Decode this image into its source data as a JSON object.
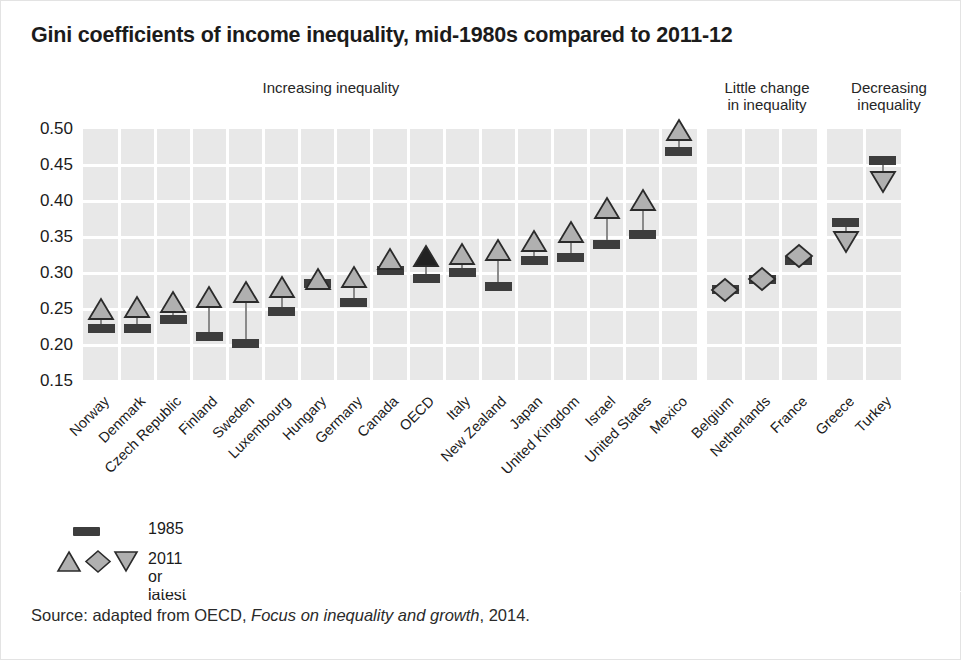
{
  "chart_data": {
    "type": "scatter",
    "title": "Gini coefficients of income inequality, mid-1980s compared to 2011-12",
    "xlabel": "",
    "ylabel": "",
    "ylim": [
      0.15,
      0.5
    ],
    "ytick_labels": [
      "0.50",
      "0.45",
      "0.40",
      "0.35",
      "0.30",
      "0.25",
      "0.20",
      "0.15"
    ],
    "ytick_values": [
      0.5,
      0.45,
      0.4,
      0.35,
      0.3,
      0.25,
      0.2,
      0.15
    ],
    "grid": true,
    "legend_position": "bottom-left",
    "series": [
      {
        "name": "1985",
        "marker": "bar",
        "values": [
          0.223,
          0.223,
          0.236,
          0.212,
          0.202,
          0.247,
          0.289,
          0.259,
          0.304,
          0.293,
          0.301,
          0.281,
          0.317,
          0.322,
          0.339,
          0.354,
          0.469,
          0.277,
          0.291,
          0.318,
          0.37,
          0.456
        ]
      },
      {
        "name": "2011 or latest",
        "marker": "triangle-up/diamond/triangle-down",
        "values": [
          0.25,
          0.253,
          0.26,
          0.266,
          0.274,
          0.281,
          0.289,
          0.295,
          0.32,
          0.324,
          0.327,
          0.332,
          0.345,
          0.357,
          0.39,
          0.401,
          0.498,
          0.277,
          0.291,
          0.323,
          0.343,
          0.427
        ]
      }
    ],
    "categories": [
      "Norway",
      "Denmark",
      "Czech Republic",
      "Finland",
      "Sweden",
      "Luxembourg",
      "Hungary",
      "Germany",
      "Canada",
      "OECD",
      "Italy",
      "New Zealand",
      "Japan",
      "United Kingdom",
      "Israel",
      "United States",
      "Mexico",
      "Belgium",
      "Netherlands",
      "France",
      "Greece",
      "Turkey"
    ],
    "points": [
      {
        "country": "Norway",
        "group": "increasing",
        "v1985": 0.223,
        "v2011": 0.25,
        "shape": "triangle-up",
        "highlight": false
      },
      {
        "country": "Denmark",
        "group": "increasing",
        "v1985": 0.223,
        "v2011": 0.253,
        "shape": "triangle-up",
        "highlight": false
      },
      {
        "country": "Czech Republic",
        "group": "increasing",
        "v1985": 0.236,
        "v2011": 0.26,
        "shape": "triangle-up",
        "highlight": false
      },
      {
        "country": "Finland",
        "group": "increasing",
        "v1985": 0.212,
        "v2011": 0.266,
        "shape": "triangle-up",
        "highlight": false
      },
      {
        "country": "Sweden",
        "group": "increasing",
        "v1985": 0.202,
        "v2011": 0.274,
        "shape": "triangle-up",
        "highlight": false
      },
      {
        "country": "Luxembourg",
        "group": "increasing",
        "v1985": 0.247,
        "v2011": 0.281,
        "shape": "triangle-up",
        "highlight": false
      },
      {
        "country": "Hungary",
        "group": "increasing",
        "v1985": 0.286,
        "v2011": 0.291,
        "shape": "triangle-up",
        "highlight": false
      },
      {
        "country": "Germany",
        "group": "increasing",
        "v1985": 0.259,
        "v2011": 0.295,
        "shape": "triangle-up",
        "highlight": false
      },
      {
        "country": "Canada",
        "group": "increasing",
        "v1985": 0.304,
        "v2011": 0.32,
        "shape": "triangle-up",
        "highlight": false
      },
      {
        "country": "OECD",
        "group": "increasing",
        "v1985": 0.293,
        "v2011": 0.324,
        "shape": "triangle-up",
        "highlight": true
      },
      {
        "country": "Italy",
        "group": "increasing",
        "v1985": 0.301,
        "v2011": 0.327,
        "shape": "triangle-up",
        "highlight": false
      },
      {
        "country": "New Zealand",
        "group": "increasing",
        "v1985": 0.281,
        "v2011": 0.332,
        "shape": "triangle-up",
        "highlight": false
      },
      {
        "country": "Japan",
        "group": "increasing",
        "v1985": 0.317,
        "v2011": 0.345,
        "shape": "triangle-up",
        "highlight": false
      },
      {
        "country": "United Kingdom",
        "group": "increasing",
        "v1985": 0.322,
        "v2011": 0.357,
        "shape": "triangle-up",
        "highlight": false
      },
      {
        "country": "Israel",
        "group": "increasing",
        "v1985": 0.339,
        "v2011": 0.39,
        "shape": "triangle-up",
        "highlight": false
      },
      {
        "country": "United States",
        "group": "increasing",
        "v1985": 0.354,
        "v2011": 0.401,
        "shape": "triangle-up",
        "highlight": false
      },
      {
        "country": "Mexico",
        "group": "increasing",
        "v1985": 0.469,
        "v2011": 0.498,
        "shape": "triangle-up",
        "highlight": false
      },
      {
        "country": "Belgium",
        "group": "little-change",
        "v1985": 0.277,
        "v2011": 0.277,
        "shape": "diamond",
        "highlight": false
      },
      {
        "country": "Netherlands",
        "group": "little-change",
        "v1985": 0.291,
        "v2011": 0.291,
        "shape": "diamond",
        "highlight": false
      },
      {
        "country": "France",
        "group": "little-change",
        "v1985": 0.318,
        "v2011": 0.323,
        "shape": "diamond",
        "highlight": false
      },
      {
        "country": "Greece",
        "group": "decreasing",
        "v1985": 0.37,
        "v2011": 0.343,
        "shape": "triangle-down",
        "highlight": false
      },
      {
        "country": "Turkey",
        "group": "decreasing",
        "v1985": 0.456,
        "v2011": 0.427,
        "shape": "triangle-down",
        "highlight": false
      }
    ]
  },
  "groups": [
    {
      "id": "increasing",
      "label": "Increasing inequality"
    },
    {
      "id": "little-change",
      "label": "Little change\nin inequality",
      "line1": "Little change",
      "line2": "in inequality"
    },
    {
      "id": "decreasing",
      "label": "Decreasing\ninequality",
      "line1": "Decreasing",
      "line2": "inequality"
    }
  ],
  "legend": {
    "items": [
      {
        "key": "bar",
        "label": "1985"
      },
      {
        "key": "shapes",
        "label": "2011 or latest"
      }
    ]
  },
  "source": {
    "prefix": "Source: adapted from OECD, ",
    "italic": "Focus on inequality and growth",
    "suffix": ", 2014."
  },
  "colors": {
    "panel": "#e8e8e8",
    "grid": "#ffffff",
    "bar1985": "#3d3d3d",
    "marker2011_fill": "#b0b0b0",
    "marker2011_stroke": "#2b2b2b",
    "marker_highlight": "#222222",
    "connector": "#8a8a8a",
    "text": "#1b1b1b",
    "background": "#ffffff"
  }
}
